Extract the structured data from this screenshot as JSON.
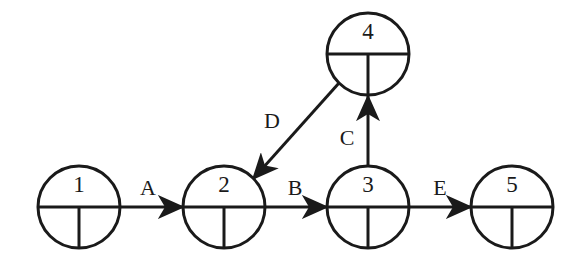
{
  "diagram": {
    "background_color": "#ffffff",
    "stroke_color": "#1a1a1a",
    "node_fill_color": "#ffffff",
    "stroke_width": 3,
    "node_radius": 41,
    "nodes": [
      {
        "id": "n1",
        "label": "1",
        "cx": 79,
        "cy": 207
      },
      {
        "id": "n2",
        "label": "2",
        "cx": 224,
        "cy": 207
      },
      {
        "id": "n3",
        "label": "3",
        "cx": 368,
        "cy": 207
      },
      {
        "id": "n5",
        "label": "5",
        "cx": 512,
        "cy": 207
      },
      {
        "id": "n4",
        "label": "4",
        "cx": 368,
        "cy": 54
      }
    ],
    "edges": [
      {
        "id": "eA",
        "label": "A",
        "from": "n1",
        "to": "n2",
        "x1": 120,
        "y1": 207,
        "x2": 183,
        "y2": 207,
        "label_x": 148,
        "label_y": 190
      },
      {
        "id": "eB",
        "label": "B",
        "from": "n2",
        "to": "n3",
        "x1": 265,
        "y1": 207,
        "x2": 327,
        "y2": 207,
        "label_x": 295,
        "label_y": 190
      },
      {
        "id": "eE",
        "label": "E",
        "from": "n3",
        "to": "n5",
        "x1": 409,
        "y1": 207,
        "x2": 471,
        "y2": 207,
        "label_x": 440,
        "label_y": 190
      },
      {
        "id": "eC",
        "label": "C",
        "from": "n3",
        "to": "n4",
        "x1": 368,
        "y1": 166,
        "x2": 368,
        "y2": 96,
        "label_x": 347,
        "label_y": 140
      },
      {
        "id": "eD",
        "label": "D",
        "from": "n4",
        "to": "n2",
        "x1": 339,
        "y1": 83,
        "x2": 253,
        "y2": 179,
        "label_x": 272,
        "label_y": 123
      }
    ]
  }
}
